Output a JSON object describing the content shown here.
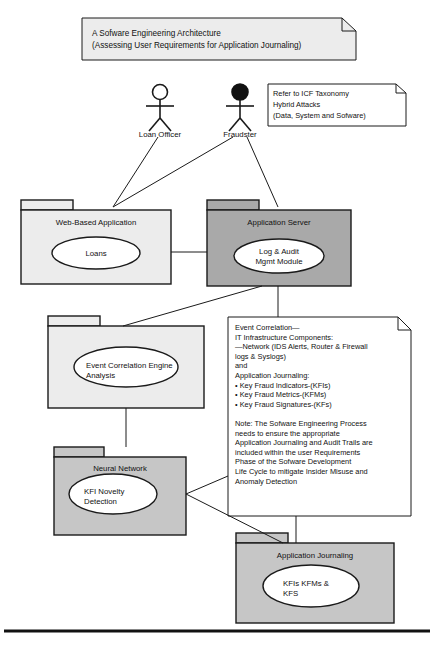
{
  "diagram": {
    "type": "uml-package-diagram",
    "title_note": {
      "lines": [
        "A Sofware Engineering Architecture",
        "(Assessing User Requirements for Application Journaling)"
      ]
    },
    "taxonomy_note": {
      "lines": [
        "Refer to ICF Taxonomy",
        "Hybrid Attacks",
        "(Data, System and Sofware)"
      ]
    },
    "actors": [
      {
        "name": "loan-officer",
        "label": "Loan Officer",
        "head": "hollow"
      },
      {
        "name": "fraudster",
        "label": "Fraudster",
        "head": "filled"
      }
    ],
    "packages": [
      {
        "name": "web-based-application",
        "title": "Web-Based Application",
        "fill": "#ececec",
        "element": {
          "lines": [
            "Loans"
          ],
          "align": "center"
        }
      },
      {
        "name": "application-server",
        "title": "Application Server",
        "fill": "#a9a9a9",
        "element": {
          "lines": [
            "Log & Audit",
            "Mgmt Module"
          ],
          "align": "center"
        }
      },
      {
        "name": "event-correlation-engine",
        "title": "",
        "fill": "#ececec",
        "element": {
          "lines": [
            "Event Correlation Engine",
            "Analysis"
          ],
          "align": "left"
        }
      },
      {
        "name": "neural-network",
        "title": "Neural Network",
        "fill": "#c6c6c6",
        "element": {
          "lines": [
            "KFI Novelty",
            "Detection"
          ],
          "align": "left"
        }
      },
      {
        "name": "application-journaling",
        "title": "Application Journaling",
        "fill": "#c6c6c6",
        "element": {
          "lines": [
            "KFIs KFMs &",
            "KFS"
          ],
          "align": "left"
        }
      }
    ],
    "detail_note": {
      "lines": [
        "Event Correlation—",
        "IT Infrastructure Components:",
        "—Network (IDS Alerts, Router & Firewall",
        "logs & Syslogs)",
        "and",
        "Application Journaling:",
        "• Key Fraud Indicators-(KFIs)",
        "• Key Fraud Metrics-(KFMs)",
        "• Key Fraud Signatures-(KFs)",
        "",
        "Note: The Sofware Engineering Process",
        "needs to ensure the appropriate",
        "Application Journaling and Audit Trails are",
        "included within the user Requirements",
        "Phase of the Sofware Development",
        "Life Cycle to mitigate Insider Misuse and",
        "Anomaly Detection"
      ]
    },
    "colors": {
      "stroke": "#1a1a1a",
      "page": "#ffffff",
      "light_fill": "#ececec",
      "mid_fill": "#c6c6c6",
      "dark_fill": "#a9a9a9",
      "note_fill": "#f2f2f2",
      "rule": "#111111"
    }
  }
}
